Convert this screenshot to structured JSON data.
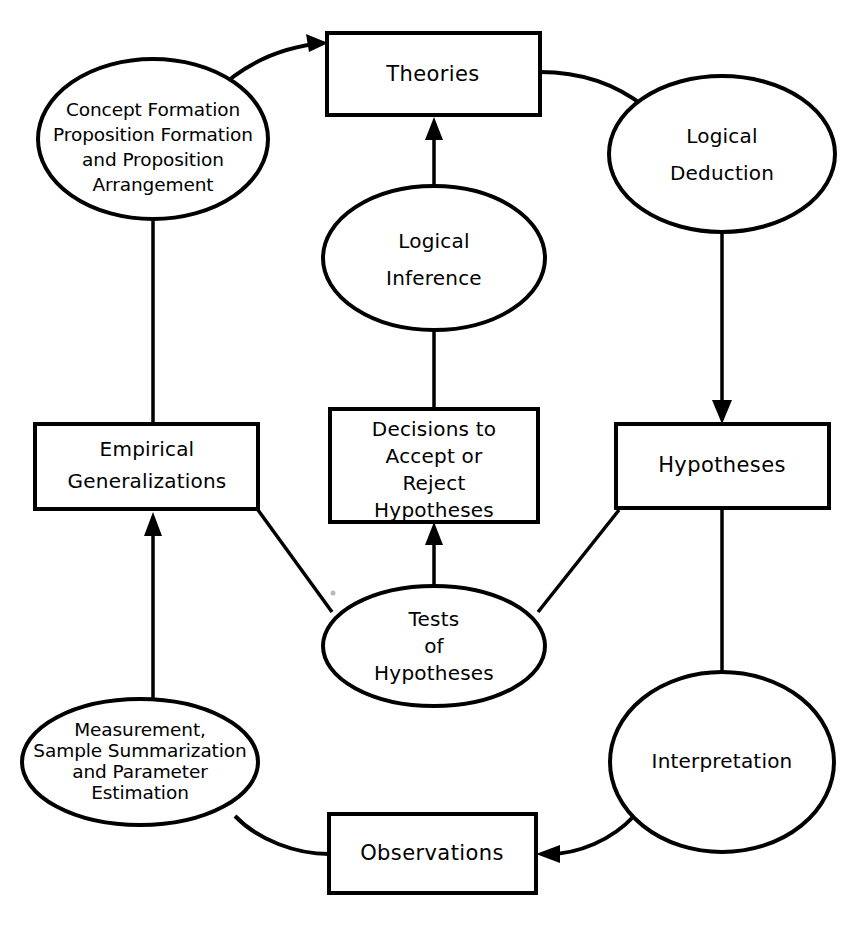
{
  "diagram": {
    "type": "cyclical-flowchart",
    "background_color": "#ffffff",
    "line_color": "#000000",
    "nodes": [
      {
        "id": "theories",
        "shape": "rectangle",
        "label": "Theories",
        "lines": [
          "Theories"
        ]
      },
      {
        "id": "concept-formation",
        "shape": "ellipse",
        "label": "Concept Formation Proposition Formation and Proposition Arrangement",
        "lines": [
          "Concept Formation",
          "Proposition Formation",
          "and Proposition",
          "Arrangement"
        ]
      },
      {
        "id": "logical-deduction",
        "shape": "ellipse",
        "label": "Logical Deduction",
        "lines": [
          "Logical",
          "Deduction"
        ]
      },
      {
        "id": "logical-inference",
        "shape": "ellipse",
        "label": "Logical Inference",
        "lines": [
          "Logical",
          "Inference"
        ]
      },
      {
        "id": "empirical-generalizations",
        "shape": "rectangle",
        "label": "Empirical Generalizations",
        "lines": [
          "Empirical",
          "Generalizations"
        ]
      },
      {
        "id": "decisions",
        "shape": "rectangle",
        "label": "Decisions to Accept or Reject Hypotheses",
        "lines": [
          "Decisions to",
          "Accept or",
          "Reject",
          "Hypotheses"
        ]
      },
      {
        "id": "hypotheses",
        "shape": "rectangle",
        "label": "Hypotheses",
        "lines": [
          "Hypotheses"
        ]
      },
      {
        "id": "tests-of-hypotheses",
        "shape": "ellipse",
        "label": "Tests of Hypotheses",
        "lines": [
          "Tests",
          "of",
          "Hypotheses"
        ]
      },
      {
        "id": "measurement",
        "shape": "ellipse",
        "label": "Measurement, Sample Summarization and Parameter Estimation",
        "lines": [
          "Measurement,",
          "Sample Summarization",
          "and Parameter",
          "Estimation"
        ]
      },
      {
        "id": "interpretation",
        "shape": "ellipse",
        "label": "Interpretation",
        "lines": [
          "Interpretation"
        ]
      },
      {
        "id": "observations",
        "shape": "rectangle",
        "label": "Observations",
        "lines": [
          "Observations"
        ]
      }
    ],
    "edges": [
      {
        "id": "concept-to-theories",
        "from": "concept-formation",
        "to": "theories",
        "style": "curved",
        "arrow": true
      },
      {
        "id": "theories-to-logical-deduction",
        "from": "theories",
        "to": "logical-deduction",
        "style": "curved",
        "arrow": false
      },
      {
        "id": "logical-deduction-to-hypotheses",
        "from": "logical-deduction",
        "to": "hypotheses",
        "style": "straight",
        "arrow": true
      },
      {
        "id": "logical-inference-to-theories",
        "from": "logical-inference",
        "to": "theories",
        "style": "straight",
        "arrow": true
      },
      {
        "id": "decisions-to-logical-inference",
        "from": "decisions",
        "to": "logical-inference",
        "style": "straight",
        "arrow": false
      },
      {
        "id": "empirical-to-concept",
        "from": "empirical-generalizations",
        "to": "concept-formation",
        "style": "straight",
        "arrow": false
      },
      {
        "id": "tests-to-empirical",
        "from": "tests-of-hypotheses",
        "to": "empirical-generalizations",
        "style": "straight",
        "arrow": false
      },
      {
        "id": "tests-to-decisions",
        "from": "tests-of-hypotheses",
        "to": "decisions",
        "style": "straight",
        "arrow": true
      },
      {
        "id": "tests-to-hypotheses-box",
        "from": "tests-of-hypotheses",
        "to": "hypotheses",
        "style": "straight",
        "arrow": false
      },
      {
        "id": "measurement-to-empirical",
        "from": "measurement",
        "to": "empirical-generalizations",
        "style": "straight",
        "arrow": true
      },
      {
        "id": "observations-to-measurement",
        "from": "observations",
        "to": "measurement",
        "style": "curved",
        "arrow": false
      },
      {
        "id": "interpretation-to-observations",
        "from": "interpretation",
        "to": "observations",
        "style": "curved",
        "arrow": true
      },
      {
        "id": "hypotheses-to-interpretation",
        "from": "hypotheses",
        "to": "interpretation",
        "style": "straight",
        "arrow": false
      }
    ]
  }
}
